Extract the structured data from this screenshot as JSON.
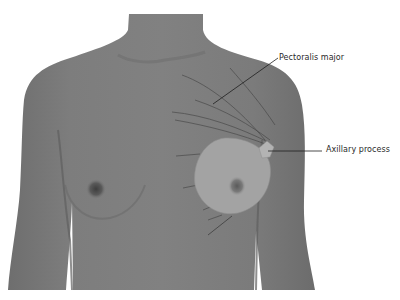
{
  "figure": {
    "type": "anatomical illustration",
    "labels": {
      "pectoralis": "Pectoralis major",
      "axillary": "Axillary process"
    }
  },
  "colors": {
    "background": "#ffffff",
    "skin": "#7c7c7c",
    "skin_dark": "#6a6a6a",
    "breast_overlay": "#a3a3a3",
    "leader_line": "#1e1e1e",
    "label_text": "#2a2a2a"
  }
}
